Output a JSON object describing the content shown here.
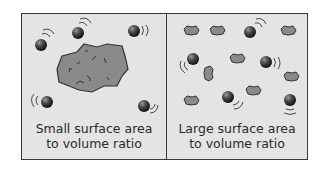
{
  "diagram": {
    "colors": {
      "panel_bg": "#e4e4e4",
      "border": "#3a3a3a",
      "chunk_fill": "#8a8a8a",
      "ball_dark": "#2a2a2a",
      "text": "#2a2a2a"
    },
    "panels": [
      {
        "id": "left",
        "caption_line1": "Small surface area",
        "caption_line2": "to volume ratio",
        "content": "one large solid chunk surrounded by 5 moving particles"
      },
      {
        "id": "right",
        "caption_line1": "Large surface area",
        "caption_line2": "to volume ratio",
        "content": "many small solid chunks interspersed with 6 moving particles"
      }
    ]
  }
}
